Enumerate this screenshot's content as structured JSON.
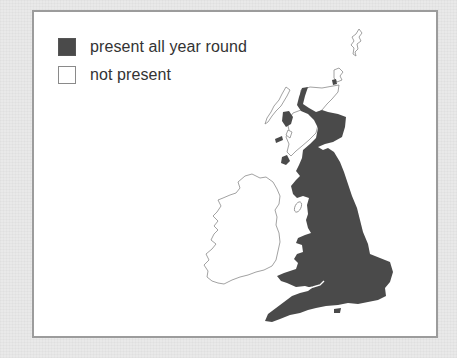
{
  "legend": {
    "items": [
      {
        "label": "present all year round",
        "state": "present",
        "color": "#4a4a4a"
      },
      {
        "label": "not present",
        "state": "absent",
        "color": "#ffffff"
      }
    ]
  },
  "map": {
    "region": "Great Britain and Ireland",
    "colors": {
      "present": "#4a4a4a",
      "absent": "#ffffff",
      "outline": "#8a8a8a",
      "frame_border": "#9c9c9c",
      "background": "#e9e9e9"
    },
    "regions": [
      {
        "name": "England",
        "state": "present"
      },
      {
        "name": "Wales",
        "state": "present"
      },
      {
        "name": "Southern Scotland",
        "state": "present"
      },
      {
        "name": "Eastern Scotland",
        "state": "present"
      },
      {
        "name": "Western Highlands strip",
        "state": "present"
      },
      {
        "name": "Northern Highlands",
        "state": "absent"
      },
      {
        "name": "Western Isles",
        "state": "absent"
      },
      {
        "name": "Shetland",
        "state": "absent"
      },
      {
        "name": "Ireland",
        "state": "absent"
      },
      {
        "name": "Isle of Man",
        "state": "absent"
      }
    ]
  }
}
